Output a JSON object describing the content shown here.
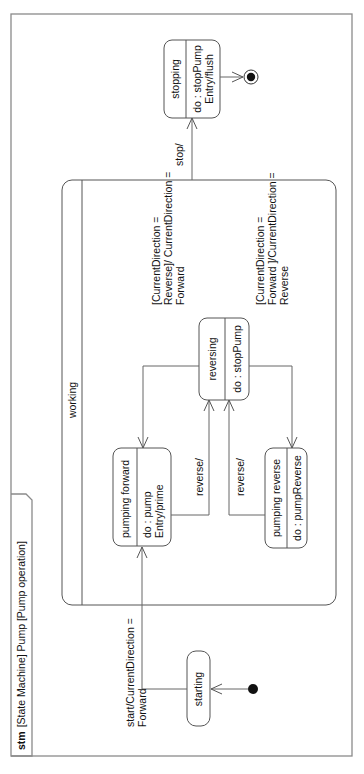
{
  "diagram": {
    "type": "UML state machine diagram",
    "orientation": "rotated 90deg counter-clockwise",
    "frame": {
      "keyword": "stm",
      "title": "[State Machine] Pump [Pump operation]"
    },
    "composite_state": {
      "name": "working"
    },
    "states": {
      "starting": {
        "name": "starting"
      },
      "pumping_forward": {
        "name": "pumping forward",
        "do": "do : pump",
        "entry": "Entry/prime"
      },
      "reversing": {
        "name": "reversing",
        "do": "do : stopPump"
      },
      "pumping_reverse": {
        "name": "pumping reverse",
        "do": "do : pumpReverse"
      },
      "stopping": {
        "name": "stopping",
        "do": "do : stopPump",
        "entry": "Entry/flush"
      }
    },
    "transitions": {
      "start": {
        "line1": "start/CurrentDirection =",
        "line2": "Forward"
      },
      "to_forward": {
        "line1": "[CurrentDirection =",
        "line2": "Reverse]/ CurrentDirection =",
        "line3": "Forward"
      },
      "to_reverse": {
        "line1": "[CurrentDirection =",
        "line2": "Forward ]/CurrentDirection =",
        "line3": "Reverse"
      },
      "reverse_from_forward": {
        "label": "reverse/"
      },
      "reverse_from_reverse": {
        "label": "reverse/"
      },
      "stop": {
        "label": "stop/"
      }
    },
    "colors": {
      "frame": "#8a8a8a",
      "stroke": "#555555",
      "text": "#111111",
      "background": "#ffffff"
    }
  }
}
